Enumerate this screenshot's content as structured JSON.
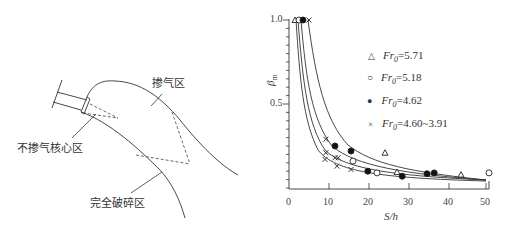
{
  "diagram": {
    "labels": {
      "aerated_zone": "掺气区",
      "non_aerated_core": "不掺气核心区",
      "fully_broken_zone": "完全破碎区"
    }
  },
  "chart_data": {
    "type": "scatter",
    "title": "",
    "xlabel": "S/h",
    "ylabel": "β_m",
    "xlim": [
      0,
      50
    ],
    "ylim": [
      0,
      1.0
    ],
    "x_ticks": [
      "0",
      "10",
      "20",
      "30",
      "40",
      "50"
    ],
    "y_ticks": [
      "0.5",
      "1.0"
    ],
    "grid": false,
    "legend_position": "upper right (inside)",
    "series": [
      {
        "name": "Fr0=5.71",
        "marker": "triangle-open",
        "points": [
          [
            1.5,
            1.0
          ],
          [
            24,
            0.21
          ],
          [
            27,
            0.095
          ],
          [
            43,
            0.08
          ]
        ]
      },
      {
        "name": "Fr0=5.18",
        "marker": "circle-open",
        "points": [
          [
            2.5,
            1.0
          ],
          [
            16,
            0.16
          ],
          [
            22,
            0.09
          ],
          [
            50,
            0.09
          ]
        ]
      },
      {
        "name": "Fr0=4.62",
        "marker": "circle-filled",
        "points": [
          [
            3.5,
            1.0
          ],
          [
            11.5,
            0.25
          ],
          [
            15.5,
            0.22
          ],
          [
            19.7,
            0.1
          ],
          [
            28.3,
            0.07
          ],
          [
            34.5,
            0.085
          ],
          [
            36.3,
            0.09
          ]
        ]
      },
      {
        "name": "Fr0=4.60~3.91",
        "marker": "cross",
        "points": [
          [
            5,
            1.0
          ],
          [
            9.2,
            0.29
          ],
          [
            9.2,
            0.21
          ],
          [
            9,
            0.17
          ],
          [
            11.5,
            0.18
          ],
          [
            12.3,
            0.18
          ],
          [
            12,
            0.13
          ],
          [
            15.5,
            0.11
          ]
        ]
      }
    ],
    "fitted_curves": 4
  },
  "legend": [
    {
      "symbol": "△",
      "prefix": "Fr",
      "sub": "0",
      "value": "=5.71"
    },
    {
      "symbol": "○",
      "prefix": "Fr",
      "sub": "0",
      "value": "=5.18"
    },
    {
      "symbol": "●",
      "prefix": "Fr",
      "sub": "0",
      "value": "=4.62"
    },
    {
      "symbol": "×",
      "prefix": "Fr",
      "sub": "0",
      "value": "=4.60~3.91"
    }
  ],
  "axes": {
    "xlabel": "S/h",
    "ylabel_main": "β",
    "ylabel_sub": "m",
    "x_ticks": [
      "0",
      "10",
      "20",
      "30",
      "40",
      "50"
    ],
    "y_ticks": [
      "1.0",
      "0.5"
    ]
  }
}
